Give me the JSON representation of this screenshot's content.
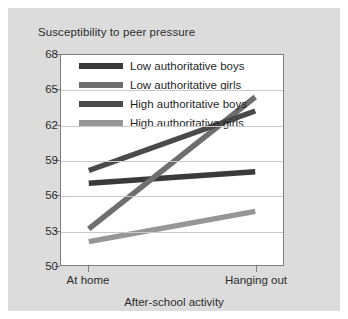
{
  "figure": {
    "background_color": "#dcdcdc",
    "plot_background_color": "#ffffff",
    "frame_color": "#7d7d7d",
    "grid_color": "#c9c9c9"
  },
  "chart_data": {
    "type": "line",
    "title": "Susceptibility to peer pressure",
    "xlabel": "After-school activity",
    "ylabel": "",
    "categories": [
      "At home",
      "Hanging out"
    ],
    "x": [
      0,
      1
    ],
    "ylim": [
      50,
      68
    ],
    "yticks": [
      50,
      53,
      56,
      59,
      62,
      65,
      68
    ],
    "grid": "horizontal",
    "legend_position": "inside-top-left",
    "series": [
      {
        "name": "Low authoritative boys",
        "color": "#3a3a3a",
        "values": [
          57.0,
          58.0
        ]
      },
      {
        "name": "Low authoritative girls",
        "color": "#6e6e6e",
        "values": [
          53.1,
          64.4
        ]
      },
      {
        "name": "High authoritative boys",
        "color": "#4a4a4a",
        "values": [
          58.1,
          63.2
        ]
      },
      {
        "name": "High authoritative girls",
        "color": "#969696",
        "values": [
          52.0,
          54.6
        ]
      }
    ]
  }
}
